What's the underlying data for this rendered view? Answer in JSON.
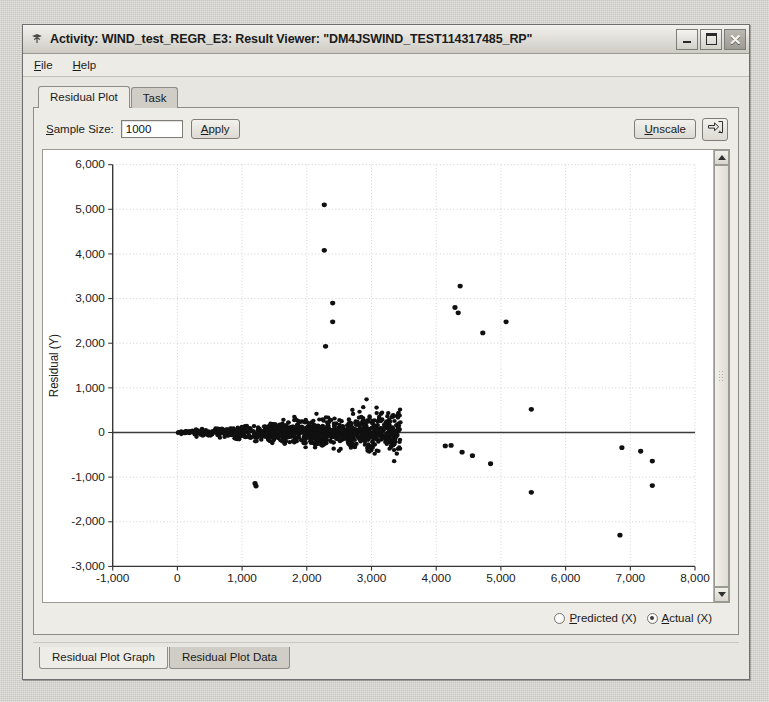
{
  "window": {
    "title": "Activity: WIND_test_REGR_E3: Result Viewer: \"DM4JSWIND_TEST114317485_RP\"",
    "title_icon": "application-icon",
    "controls": {
      "minimize": "minimize-button",
      "maximize": "maximize-button",
      "close_glyph": "✕"
    }
  },
  "menubar": {
    "items": [
      {
        "mnemonic": "F",
        "rest": "ile"
      },
      {
        "mnemonic": "H",
        "rest": "elp"
      }
    ]
  },
  "tabs": {
    "items": [
      {
        "label": "Residual Plot",
        "active": true
      },
      {
        "label": "Task",
        "active": false
      }
    ]
  },
  "toolbar": {
    "sample_size_label_mnemonic": "S",
    "sample_size_label_rest": "ample Size:",
    "sample_size_value": "1000",
    "apply_mnemonic": "A",
    "apply_rest": "pply",
    "unscale_mnemonic": "U",
    "unscale_rest": "nscale",
    "export_icon": "export-arrow-icon"
  },
  "options": {
    "radios": [
      {
        "mnemonic": "P",
        "rest": "redicted (X)",
        "checked": false
      },
      {
        "mnemonic": "A",
        "rest": "ctual (X)",
        "checked": true
      }
    ]
  },
  "bottom_tabs": {
    "items": [
      {
        "label": "Residual Plot Graph",
        "active": true
      },
      {
        "label": "Residual Plot Data",
        "active": false
      }
    ]
  },
  "scrollbar": {
    "up_arrow": "scroll-up-arrow-icon",
    "down_arrow": "scroll-down-arrow-icon",
    "thumb": "scroll-thumb"
  },
  "chart_data": {
    "type": "scatter",
    "title": "",
    "xlabel": "",
    "ylabel": "Residual (Y)",
    "xlim": [
      -1000,
      8000
    ],
    "ylim": [
      -3000,
      6000
    ],
    "xticks": [
      -1000,
      0,
      1000,
      2000,
      3000,
      4000,
      5000,
      6000,
      7000,
      8000
    ],
    "yticks": [
      -3000,
      -2000,
      -1000,
      0,
      1000,
      2000,
      3000,
      4000,
      5000,
      6000
    ],
    "xtick_labels": [
      "-1,000",
      "0",
      "1,000",
      "2,000",
      "3,000",
      "4,000",
      "5,000",
      "6,000",
      "7,000",
      "8,000"
    ],
    "ytick_labels": [
      "-3,000",
      "-2,000",
      "-1,000",
      "0",
      "1,000",
      "2,000",
      "3,000",
      "4,000",
      "5,000",
      "6,000"
    ],
    "grid": true,
    "grid_color": "#c8c8c8",
    "marker_color": "#101010",
    "marker_size": 4,
    "reference_line": {
      "y": 0,
      "color": "#3a3a3a",
      "from_x": -1000,
      "to_x": 8000
    },
    "legend": [],
    "outliers": [
      [
        2270,
        5100
      ],
      [
        2270,
        4080
      ],
      [
        2400,
        2900
      ],
      [
        2400,
        2480
      ],
      [
        2290,
        1930
      ],
      [
        4370,
        3280
      ],
      [
        4290,
        2800
      ],
      [
        4340,
        2680
      ],
      [
        4720,
        2230
      ],
      [
        5080,
        2480
      ],
      [
        5470,
        520
      ],
      [
        1200,
        -1140
      ],
      [
        1215,
        -1200
      ],
      [
        4140,
        -300
      ],
      [
        4230,
        -290
      ],
      [
        4400,
        -440
      ],
      [
        4560,
        -520
      ],
      [
        4840,
        -700
      ],
      [
        5470,
        -1340
      ],
      [
        6840,
        -2300
      ],
      [
        6870,
        -340
      ],
      [
        7160,
        -420
      ],
      [
        7340,
        -640
      ],
      [
        7340,
        -1190
      ]
    ],
    "cluster_description": {
      "n_points": 1000,
      "x_range": [
        0,
        3450
      ],
      "fan_shape": true,
      "center_y": 0,
      "spread_at_x0": 20,
      "spread_at_x3000": 420
    }
  }
}
